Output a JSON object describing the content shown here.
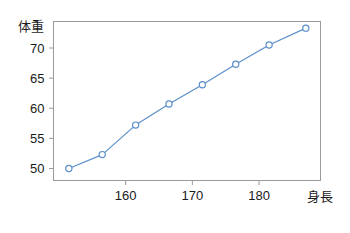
{
  "chart_data": {
    "type": "line",
    "title": "",
    "xlabel": "身長",
    "ylabel": "体重",
    "x": [
      151.5,
      156.5,
      161.5,
      166.5,
      171.5,
      176.5,
      181.5,
      187.0
    ],
    "values": [
      50.0,
      52.3,
      57.2,
      60.7,
      63.9,
      67.3,
      70.5,
      73.3
    ],
    "series": [
      {
        "name": "体重",
        "values": [
          50.0,
          52.3,
          57.2,
          60.7,
          63.9,
          67.3,
          70.5,
          73.3
        ]
      }
    ],
    "xlim": [
      149.2,
      189.2
    ],
    "ylim": [
      48.0,
      74.4
    ],
    "xticks": [
      160,
      170,
      180
    ],
    "xtick_labels": [
      "160",
      "170",
      "180"
    ],
    "yticks": [
      50,
      55,
      60,
      65,
      70
    ],
    "ytick_labels": [
      "50",
      "55",
      "60",
      "65",
      "70"
    ],
    "grid": false,
    "legend": false,
    "legend_position": "none",
    "line_color": "#5B8FC9",
    "marker": "circle-open",
    "marker_face_color": "#ffffff",
    "frame_color": "#9a9a9a",
    "text_color": "#1a1a1a"
  }
}
